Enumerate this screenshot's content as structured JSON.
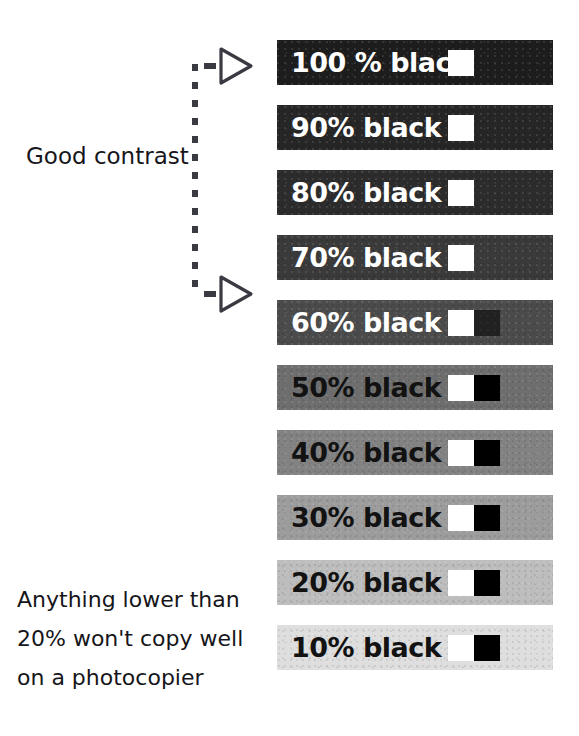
{
  "figure": {
    "background_color": "#ffffff",
    "ink_color": "#16161a"
  },
  "annotations": {
    "good_contrast_label": "Good contrast",
    "warning_lines": [
      "Anything lower than",
      "20% won't copy well",
      "on a photocopier"
    ],
    "bracket": {
      "style": "dashed",
      "arrow_count": 2,
      "arrow_icon": "triangle-right-icon",
      "covers_rows": [
        "100 % black",
        "70% black"
      ]
    }
  },
  "chart_data": {
    "type": "bar",
    "xlabel": "",
    "ylabel": "",
    "categories": [
      "100 % black",
      "90% black",
      "80% black",
      "70% black",
      "60% black",
      "50% black",
      "40% black",
      "30% black",
      "20% black",
      "10% black"
    ],
    "values": [
      100,
      90,
      80,
      70,
      60,
      50,
      40,
      30,
      20,
      10
    ],
    "legend": [],
    "grid": false,
    "swatches": [
      {
        "label": "100 % black",
        "tint": 100,
        "fill": "#1d1d1d",
        "text_color": "#ffffff",
        "black_chip_visible": false
      },
      {
        "label": "90% black",
        "tint": 90,
        "fill": "#262626",
        "text_color": "#ffffff",
        "black_chip_visible": false
      },
      {
        "label": "80% black",
        "tint": 80,
        "fill": "#2c2c2c",
        "text_color": "#ffffff",
        "black_chip_visible": false
      },
      {
        "label": "70% black",
        "tint": 70,
        "fill": "#3a3a3a",
        "text_color": "#ffffff",
        "black_chip_visible": false
      },
      {
        "label": "60% black",
        "tint": 60,
        "fill": "#4b4b4b",
        "text_color": "#ffffff",
        "black_chip_visible": true
      },
      {
        "label": "50% black",
        "tint": 50,
        "fill": "#6e6e6e",
        "text_color": "#121212",
        "black_chip_visible": true
      },
      {
        "label": "40% black",
        "tint": 40,
        "fill": "#828282",
        "text_color": "#121212",
        "black_chip_visible": true
      },
      {
        "label": "30% black",
        "tint": 30,
        "fill": "#9c9c9c",
        "text_color": "#121212",
        "black_chip_visible": true
      },
      {
        "label": "20% black",
        "tint": 20,
        "fill": "#bdbdbd",
        "text_color": "#121212",
        "black_chip_visible": true
      },
      {
        "label": "10% black",
        "tint": 10,
        "fill": "#dedede",
        "text_color": "#121212",
        "black_chip_visible": true
      }
    ]
  }
}
